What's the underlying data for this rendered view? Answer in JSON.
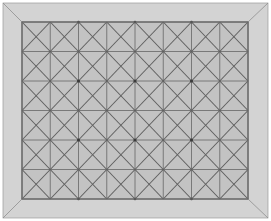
{
  "canvas": {
    "width": 271,
    "height": 221,
    "background": "#ffffff"
  },
  "frame": {
    "label": "beveled-frame",
    "outer": {
      "x": 3,
      "y": 3,
      "width": 265,
      "height": 215
    },
    "inner": {
      "x": 22,
      "y": 22,
      "width": 226,
      "height": 177
    },
    "fill": "#d3d3d3",
    "edge_color": "#9a9a9a",
    "miter_color": "#8f8f8f",
    "miter_corners": [
      "top-left",
      "top-right",
      "bottom-left",
      "bottom-right"
    ]
  },
  "panel": {
    "label": "mesh-panel",
    "x": 22,
    "y": 22,
    "width": 226,
    "height": 177,
    "fill": "#c3c3c3",
    "outline_color": "#6d6d6d"
  },
  "mesh": {
    "type": "triangulated-quad-grid",
    "columns": 8,
    "rows": 6,
    "cell_width": 28.25,
    "cell_height": 29.5,
    "grid_color": "#717171",
    "diagonal_color": "#5f5f5f",
    "node_color": "#3c3c3c",
    "node_radius": 1.6,
    "diagonals_per_cell": 2,
    "node_parity": "even-even",
    "triangle_count": 192,
    "vertex_count": 111
  },
  "chart_data": {
    "type": "table",
    "columns": [
      "property",
      "value"
    ],
    "rows": [
      [
        "columns",
        "8"
      ],
      [
        "rows",
        "6"
      ],
      [
        "cells",
        "48"
      ],
      [
        "triangles per cell",
        "4"
      ],
      [
        "total triangles",
        "192"
      ],
      [
        "grid vertices",
        "63"
      ],
      [
        "cell-center vertices",
        "48"
      ],
      [
        "highlighted nodes",
        "15"
      ]
    ]
  }
}
